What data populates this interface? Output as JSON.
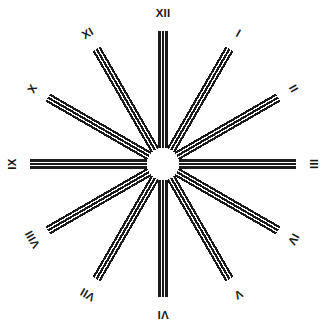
{
  "figure": {
    "background_color": "#ffffff",
    "ink_color": "#1a1a1a",
    "center_x": 163,
    "center_y": 164,
    "hub_radius": 14,
    "spoke_inner_radius": 16,
    "spoke_outer_radius": 133,
    "spoke_count": 12,
    "bars_per_spoke": 3,
    "bar_thickness": 2.2,
    "bar_gap": 1.3,
    "label_radius": 150
  },
  "chart_data": {
    "type": "scatter",
    "xlabel": "",
    "ylabel": "",
    "categories": [
      "I",
      "II",
      "III",
      "IV",
      "V",
      "VI",
      "VII",
      "VIII",
      "IX",
      "X",
      "XI",
      "XII"
    ],
    "values": [
      30,
      60,
      90,
      120,
      150,
      180,
      210,
      240,
      270,
      300,
      330,
      360
    ],
    "series": [
      {
        "name": "spoke angle (degrees clockwise from 12 o'clock)",
        "values": [
          30,
          60,
          90,
          120,
          150,
          180,
          210,
          240,
          270,
          300,
          330,
          0
        ]
      }
    ],
    "legend_position": "none",
    "grid": false
  },
  "marks": [
    {
      "label": "XII",
      "angle": 0,
      "label_rotation": 0
    },
    {
      "label": "I",
      "angle": 30,
      "label_rotation": 30
    },
    {
      "label": "II",
      "angle": 60,
      "label_rotation": 60
    },
    {
      "label": "III",
      "angle": 90,
      "label_rotation": 90
    },
    {
      "label": "IV",
      "angle": 120,
      "label_rotation": 120
    },
    {
      "label": "V",
      "angle": 150,
      "label_rotation": 150
    },
    {
      "label": "VI",
      "angle": 180,
      "label_rotation": 180
    },
    {
      "label": "VII",
      "angle": 210,
      "label_rotation": 210
    },
    {
      "label": "VIII",
      "angle": 240,
      "label_rotation": 240
    },
    {
      "label": "IX",
      "angle": 270,
      "label_rotation": 270
    },
    {
      "label": "X",
      "angle": 300,
      "label_rotation": 300
    },
    {
      "label": "XI",
      "angle": 330,
      "label_rotation": 330
    }
  ]
}
